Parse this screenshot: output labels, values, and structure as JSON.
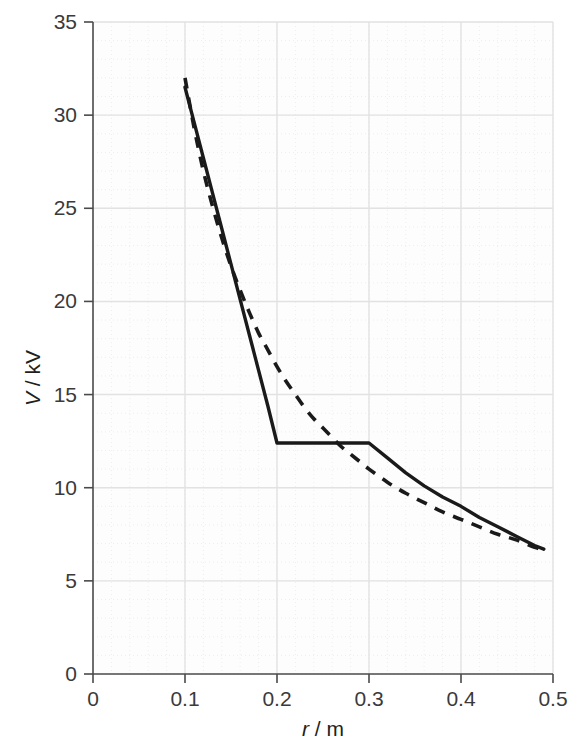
{
  "figure": {
    "background_color": "#ffffff",
    "plot_background_color": "#fdfdfd",
    "axis_color": "#4a4a4a",
    "major_grid_color": "#e2e2e2",
    "minor_grid_color": "#eeeeee",
    "curve_color": "#1a1a1a"
  },
  "axes": {
    "x": {
      "title_var": "r",
      "title_sep": "/",
      "title_unit": "m",
      "title_full": "r/m",
      "min": 0,
      "max": 0.5,
      "major_step": 0.1,
      "minor_step": 0.02,
      "ticks": [
        "0",
        "0.1",
        "0.2",
        "0.3",
        "0.4",
        "0.5"
      ],
      "tick_values": [
        0,
        0.1,
        0.2,
        0.3,
        0.4,
        0.5
      ]
    },
    "y": {
      "title_var": "V",
      "title_sep": "/",
      "title_unit": "kV",
      "title_full": "V/kV",
      "min": 0,
      "max": 35,
      "major_step": 5,
      "minor_step": 1,
      "ticks": [
        "0",
        "5",
        "10",
        "15",
        "20",
        "25",
        "30",
        "35"
      ],
      "tick_values": [
        0,
        5,
        10,
        15,
        20,
        25,
        30,
        35
      ]
    }
  },
  "chart_data": {
    "type": "line",
    "title": "",
    "xlabel": "r/m",
    "ylabel": "V/kV",
    "xlim": [
      0,
      0.5
    ],
    "ylim": [
      0,
      35
    ],
    "grid": true,
    "legend": "none",
    "series": [
      {
        "name": "solid-curve",
        "style": "solid",
        "color": "#1a1a1a",
        "x": [
          0.1,
          0.11,
          0.12,
          0.13,
          0.14,
          0.15,
          0.16,
          0.17,
          0.18,
          0.19,
          0.2,
          0.22,
          0.24,
          0.26,
          0.28,
          0.3,
          0.32,
          0.34,
          0.36,
          0.38,
          0.4,
          0.42,
          0.44,
          0.46,
          0.48,
          0.49
        ],
        "y": [
          31.5,
          29.6,
          27.7,
          25.8,
          23.9,
          22.0,
          20.1,
          18.2,
          16.3,
          14.4,
          12.4,
          12.4,
          12.4,
          12.4,
          12.4,
          12.4,
          11.6,
          10.8,
          10.1,
          9.5,
          9.0,
          8.4,
          7.9,
          7.4,
          6.9,
          6.7
        ]
      },
      {
        "name": "dashed-curve",
        "style": "dashed",
        "color": "#1a1a1a",
        "x": [
          0.1,
          0.11,
          0.12,
          0.13,
          0.14,
          0.15,
          0.16,
          0.17,
          0.18,
          0.19,
          0.2,
          0.21,
          0.22,
          0.23,
          0.24,
          0.25,
          0.26,
          0.27,
          0.28,
          0.29,
          0.3,
          0.32,
          0.34,
          0.36,
          0.38,
          0.4,
          0.42,
          0.44,
          0.46,
          0.48,
          0.49
        ],
        "y": [
          32.0,
          29.3,
          27.0,
          25.1,
          23.4,
          21.9,
          20.6,
          19.4,
          18.3,
          17.4,
          16.5,
          15.7,
          15.0,
          14.3,
          13.7,
          13.2,
          12.7,
          12.2,
          11.8,
          11.4,
          11.0,
          10.3,
          9.7,
          9.2,
          8.7,
          8.3,
          7.9,
          7.5,
          7.2,
          6.8,
          6.7
        ]
      }
    ],
    "annotations": [
      {
        "text": "solid curve plateaus at V = 12.4 kV between r = 0.2 m and r = 0.3 m"
      },
      {
        "text": "curves cross near r = 0.25 m"
      },
      {
        "text": "curves converge at r = 0.49 m, V = 6.7 kV"
      }
    ]
  }
}
